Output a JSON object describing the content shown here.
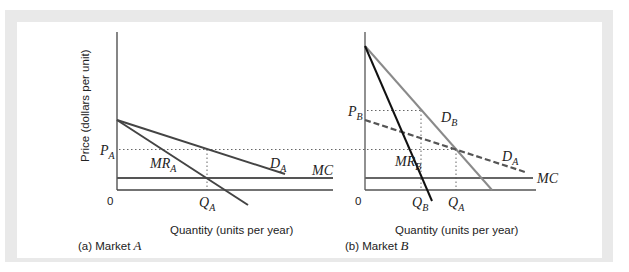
{
  "figure": {
    "panels": [
      {
        "caption_prefix": "(a) Market ",
        "caption_var": "A",
        "ylabel": "Price (dollars per unit)",
        "xlabel": "Quantity (units per year)",
        "origin": "0",
        "labels": {
          "price": "P",
          "price_sub": "A",
          "qty": "Q",
          "qty_sub": "A",
          "demand": "D",
          "demand_sub": "A",
          "mr": "MR",
          "mr_sub": "A",
          "mc": "MC"
        }
      },
      {
        "caption_prefix": "(b) Market ",
        "caption_var": "B",
        "xlabel": "Quantity (units per year)",
        "origin": "0",
        "labels": {
          "price": "P",
          "price_sub": "B",
          "qty_b": "Q",
          "qty_b_sub": "B",
          "qty_a": "Q",
          "qty_a_sub": "A",
          "demand_b": "D",
          "demand_b_sub": "B",
          "demand_a": "D",
          "demand_a_sub": "A",
          "mr": "MR",
          "mr_sub": "B",
          "mc": "MC"
        }
      }
    ],
    "colors": {
      "frame": "#e9e9e9",
      "curve_dark": "#444444",
      "curve_gray": "#8a8a8a",
      "mr_b": "#111111"
    }
  }
}
